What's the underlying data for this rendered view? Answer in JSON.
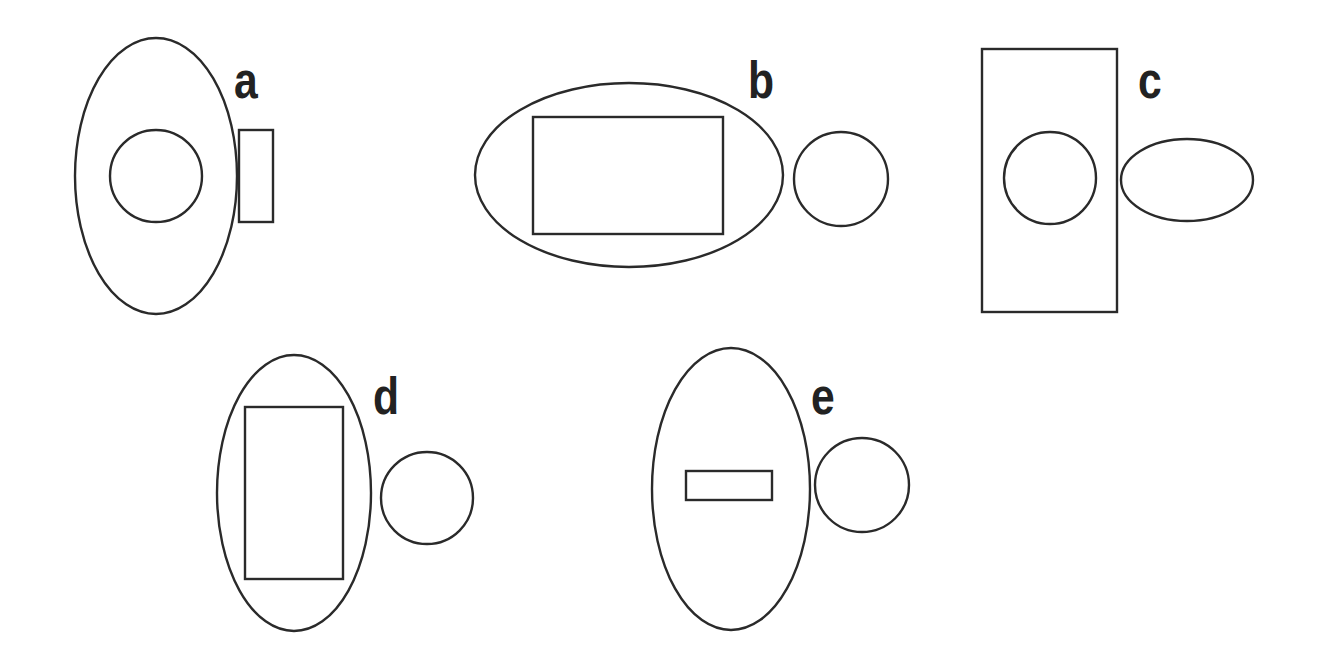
{
  "diagram": {
    "stroke_color": "#2a2a2a",
    "background": "#ffffff",
    "label_color": "#222222",
    "panels": [
      {
        "label": "a",
        "label_pos": [
          234,
          54
        ],
        "shapes": [
          {
            "type": "ellipse",
            "role": "outer",
            "cx": 156,
            "cy": 176,
            "rx": 81,
            "ry": 138
          },
          {
            "type": "circle",
            "role": "inner",
            "cx": 156,
            "cy": 176,
            "r": 46
          },
          {
            "type": "rect",
            "role": "adjacent",
            "x": 239,
            "y": 130,
            "w": 34,
            "h": 92
          }
        ]
      },
      {
        "label": "b",
        "label_pos": [
          748,
          54
        ],
        "shapes": [
          {
            "type": "ellipse",
            "role": "outer",
            "cx": 629,
            "cy": 175,
            "rx": 154,
            "ry": 92
          },
          {
            "type": "rect",
            "role": "inner",
            "x": 533,
            "y": 117,
            "w": 190,
            "h": 117
          },
          {
            "type": "circle",
            "role": "adjacent",
            "cx": 841,
            "cy": 179,
            "r": 47
          }
        ]
      },
      {
        "label": "c",
        "label_pos": [
          1138,
          54
        ],
        "shapes": [
          {
            "type": "rect",
            "role": "outer",
            "x": 982,
            "y": 49,
            "w": 135,
            "h": 263
          },
          {
            "type": "circle",
            "role": "inner",
            "cx": 1050,
            "cy": 178,
            "r": 46
          },
          {
            "type": "ellipse",
            "role": "adjacent",
            "cx": 1187,
            "cy": 180,
            "rx": 66,
            "ry": 41
          }
        ]
      },
      {
        "label": "d",
        "label_pos": [
          373,
          370
        ],
        "shapes": [
          {
            "type": "ellipse",
            "role": "outer",
            "cx": 294,
            "cy": 493,
            "rx": 77,
            "ry": 138
          },
          {
            "type": "rect",
            "role": "inner",
            "x": 245,
            "y": 407,
            "w": 98,
            "h": 172
          },
          {
            "type": "circle",
            "role": "adjacent",
            "cx": 427,
            "cy": 498,
            "r": 46
          }
        ]
      },
      {
        "label": "e",
        "label_pos": [
          811,
          370
        ],
        "shapes": [
          {
            "type": "ellipse",
            "role": "outer",
            "cx": 731,
            "cy": 489,
            "rx": 79,
            "ry": 141
          },
          {
            "type": "rect",
            "role": "inner",
            "x": 686,
            "y": 471,
            "w": 86,
            "h": 29
          },
          {
            "type": "circle",
            "role": "adjacent",
            "cx": 862,
            "cy": 485,
            "r": 47
          }
        ]
      }
    ]
  }
}
